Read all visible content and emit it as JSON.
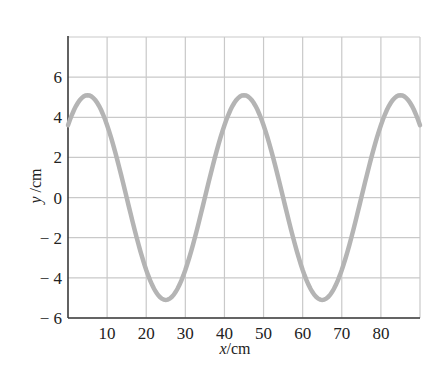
{
  "chart_data": {
    "type": "line",
    "title": "",
    "xlabel": "x/cm",
    "ylabel": "y/cm",
    "xlim": [
      0,
      90
    ],
    "ylim": [
      -6,
      8
    ],
    "grid": true,
    "x_ticks": [
      10,
      20,
      30,
      40,
      50,
      60,
      70,
      80
    ],
    "y_ticks": [
      6,
      4,
      2,
      0,
      -2,
      -4,
      -6
    ],
    "y_tick_labels": [
      "6",
      "4",
      "2",
      "0",
      "− 2",
      "− 4",
      "− 6"
    ],
    "x_gridlines": [
      10,
      20,
      30,
      40,
      50,
      60,
      70,
      80,
      90
    ],
    "y_gridlines": [
      -6,
      -4,
      -2,
      0,
      2,
      4,
      6,
      8
    ],
    "series": [
      {
        "name": "wave",
        "function": "y = A*cos(2*pi*(x - x_peak)/wavelength)",
        "amplitude": 5.1,
        "wavelength": 40,
        "x_peak": 5,
        "x": [
          0,
          5,
          10,
          15,
          20,
          25,
          30,
          35,
          40,
          45,
          50,
          55,
          60,
          65,
          70,
          75,
          80,
          85,
          90
        ],
        "values": [
          3.6,
          5.1,
          3.6,
          0,
          -3.6,
          -5.1,
          -3.6,
          0,
          3.6,
          5.1,
          3.6,
          0,
          -3.6,
          -5.1,
          -3.6,
          0,
          3.6,
          5.1,
          3.6
        ],
        "color": "#b4b4b4"
      }
    ]
  },
  "colors": {
    "curve": "#b4b4b4",
    "grid": "#c9c9c9",
    "axis": "#3a3a3a",
    "text": "#222222"
  }
}
